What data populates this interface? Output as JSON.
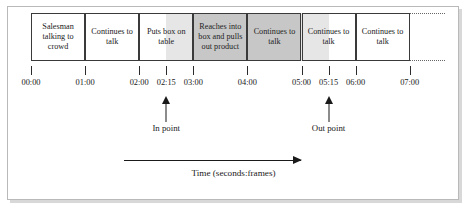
{
  "figure": {
    "caption": "Time (seconds:frames)",
    "accent_color": "#1a1a1a",
    "shade_color": "#dcdcdc",
    "border_color": "#3a3a3a"
  },
  "timeline": {
    "start_seconds": 0,
    "end_seconds": 7,
    "pixels_per_second": 54.1,
    "continuation": "dotted",
    "segments": [
      {
        "label": "Salesman talking to crowd",
        "start": "00:00",
        "end": "01:00",
        "start_sec": 0.0,
        "end_sec": 1.0,
        "shaded": false
      },
      {
        "label": "Continues to talk",
        "start": "01:00",
        "end": "02:00",
        "start_sec": 1.0,
        "end_sec": 2.0,
        "shaded": false
      },
      {
        "label": "Puts box on table",
        "start": "02:00",
        "end": "03:00",
        "start_sec": 2.0,
        "end_sec": 3.0,
        "shaded": false
      },
      {
        "label": "Reaches into box and pulls out product",
        "start": "03:00",
        "end": "04:00",
        "start_sec": 3.0,
        "end_sec": 4.0,
        "shaded": true
      },
      {
        "label": "Continues to talk",
        "start": "04:00",
        "end": "05:00",
        "start_sec": 4.0,
        "end_sec": 5.0,
        "shaded": true
      },
      {
        "label": "Continues to talk",
        "start": "05:00",
        "end": "06:00",
        "start_sec": 5.0,
        "end_sec": 6.0,
        "shaded": false
      },
      {
        "label": "Continues to talk",
        "start": "06:00",
        "end": "07:00",
        "start_sec": 6.0,
        "end_sec": 7.0,
        "shaded": false
      }
    ]
  },
  "axis": {
    "ticks": [
      {
        "label": "00:00",
        "sec": 0.0
      },
      {
        "label": "01:00",
        "sec": 1.0
      },
      {
        "label": "02:00",
        "sec": 2.0
      },
      {
        "label": "02:15",
        "sec": 2.5
      },
      {
        "label": "03:00",
        "sec": 3.0
      },
      {
        "label": "04:00",
        "sec": 4.0
      },
      {
        "label": "05:00",
        "sec": 5.0
      },
      {
        "label": "05:15",
        "sec": 5.5
      },
      {
        "label": "06:00",
        "sec": 6.0
      },
      {
        "label": "07:00",
        "sec": 7.0
      }
    ]
  },
  "markers": {
    "in_point": {
      "label": "In point",
      "time": "02:15",
      "sec": 2.5
    },
    "out_point": {
      "label": "Out point",
      "time": "05:15",
      "sec": 5.5
    }
  },
  "selection": {
    "from_sec": 2.5,
    "to_sec": 5.5
  }
}
